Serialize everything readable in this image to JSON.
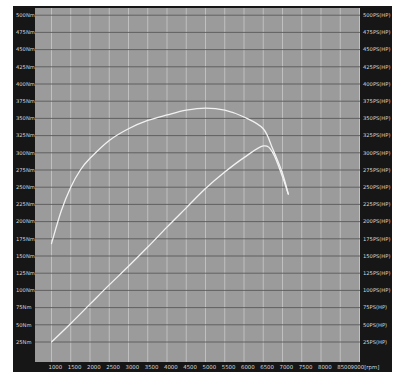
{
  "chart_data": {
    "type": "line",
    "title": "",
    "xlabel": "[rpm]",
    "ylabel_left": "Nm",
    "ylabel_right": "PS(HP)",
    "xlim": [
      800,
      9000
    ],
    "ylim_left": [
      0,
      500
    ],
    "ylim_right": [
      0,
      500
    ],
    "grid": true,
    "legend": null,
    "x_ticks": [
      1000,
      1500,
      2000,
      2500,
      3000,
      3500,
      4000,
      4500,
      5000,
      5500,
      6000,
      6500,
      7000,
      7500,
      8000,
      8500,
      9000
    ],
    "x_tick_labels": [
      "1000",
      "1500",
      "2000",
      "2500",
      "3000",
      "3500",
      "4000",
      "4500",
      "5000",
      "5500",
      "6000",
      "6500",
      "7000",
      "7500",
      "8000",
      "8500",
      "9000[rpm]"
    ],
    "y_left_ticks": [
      25,
      50,
      75,
      100,
      125,
      150,
      175,
      200,
      225,
      250,
      275,
      300,
      325,
      350,
      375,
      400,
      425,
      450,
      475,
      500
    ],
    "y_left_tick_labels": [
      "25Nm",
      "50Nm",
      "75Nm",
      "100Nm",
      "125Nm",
      "150Nm",
      "175Nm",
      "200Nm",
      "225Nm",
      "250Nm",
      "275Nm",
      "300Nm",
      "325Nm",
      "350Nm",
      "375Nm",
      "400Nm",
      "425Nm",
      "450Nm",
      "475Nm",
      "500Nm"
    ],
    "y_right_tick_labels": [
      "25PS(HP)",
      "50PS(HP)",
      "75PS(HP)",
      "100PS(HP)",
      "125PS(HP)",
      "150PS(HP)",
      "175PS(HP)",
      "200PS(HP)",
      "225PS(HP)",
      "250PS(HP)",
      "275PS(HP)",
      "300PS(HP)",
      "325PS(HP)",
      "350PS(HP)",
      "375PS(HP)",
      "400PS(HP)",
      "425PS(HP)",
      "450PS(HP)",
      "475PS(HP)",
      "500PS(HP)"
    ],
    "series": [
      {
        "name": "Torque (Nm)",
        "axis": "left",
        "x": [
          1000,
          1250,
          1500,
          1750,
          2000,
          2500,
          3000,
          3500,
          4000,
          4500,
          5000,
          5500,
          6000,
          6500,
          6750,
          7000,
          7150
        ],
        "values": [
          168,
          215,
          250,
          275,
          292,
          318,
          335,
          347,
          355,
          362,
          365,
          362,
          352,
          335,
          305,
          270,
          240
        ]
      },
      {
        "name": "Power (PS)",
        "axis": "left",
        "x": [
          1000,
          1500,
          2000,
          2500,
          3000,
          3500,
          4000,
          4500,
          5000,
          5500,
          6000,
          6500,
          6750,
          7000,
          7150
        ],
        "values": [
          25,
          52,
          80,
          108,
          135,
          163,
          192,
          220,
          248,
          272,
          293,
          310,
          300,
          265,
          240
        ]
      }
    ]
  },
  "colors": {
    "frame": "#161616",
    "plot_bg": "#9b9b9b",
    "grid_h": "#5a5a5a",
    "grid_v": "#c4c4c4",
    "curve": "#f2f2f2",
    "label": "#d8d8d8"
  }
}
